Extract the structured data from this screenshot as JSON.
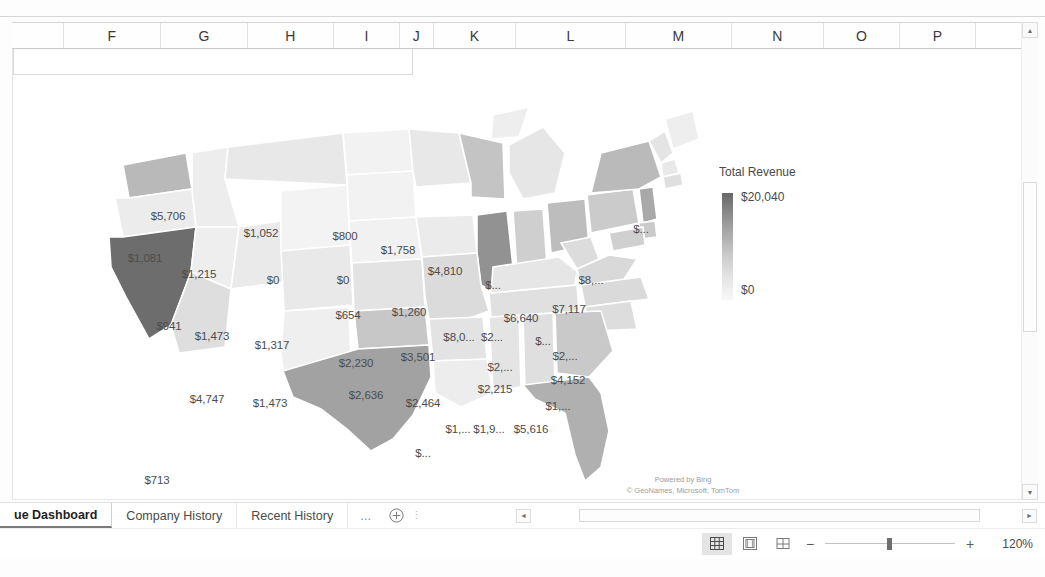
{
  "app": {
    "type": "spreadsheet",
    "zoom_level": "120%"
  },
  "columns": [
    "F",
    "G",
    "H",
    "I",
    "J",
    "K",
    "L",
    "M",
    "N",
    "O",
    "P"
  ],
  "chart": {
    "title": "",
    "legend": {
      "title": "Total Revenue",
      "max_label": "$20,040",
      "min_label": "$0",
      "gradient_high": "#686868",
      "gradient_low": "#f7f7f7"
    },
    "attribution_line1": "Powered by Bing",
    "attribution_line2": "© GeoNames, Microsoft, TomTom"
  },
  "chart_data": {
    "type": "map",
    "title": "Total Revenue",
    "value_prefix": "$",
    "legend_position": "right",
    "value_range": [
      0,
      20040
    ],
    "regions": [
      {
        "name": "Washington",
        "label": "$5,706",
        "value": 5706,
        "x": 155,
        "y": 141,
        "light": false
      },
      {
        "name": "Montana",
        "label": "$1,052",
        "value": 1052,
        "x": 248,
        "y": 158,
        "light": false
      },
      {
        "name": "North Dakota",
        "label": "$800",
        "value": 800,
        "x": 332,
        "y": 161,
        "light": false
      },
      {
        "name": "Minnesota",
        "label": "$1,758",
        "value": 1758,
        "x": 385,
        "y": 175,
        "light": false
      },
      {
        "name": "Maine",
        "label": "$...",
        "value": null,
        "x": 628,
        "y": 154,
        "light": false
      },
      {
        "name": "Oregon",
        "label": "$1,081",
        "value": 1081,
        "x": 132,
        "y": 183,
        "light": false
      },
      {
        "name": "Idaho",
        "label": "$1,215",
        "value": 1215,
        "x": 186,
        "y": 199,
        "light": false
      },
      {
        "name": "Wyoming",
        "label": "$0",
        "value": 0,
        "x": 260,
        "y": 205,
        "light": false
      },
      {
        "name": "South Dakota",
        "label": "$0",
        "value": 0,
        "x": 330,
        "y": 205,
        "light": false
      },
      {
        "name": "Wisconsin",
        "label": "$4,810",
        "value": 4810,
        "x": 432,
        "y": 196,
        "light": false
      },
      {
        "name": "Michigan",
        "label": "$...",
        "value": null,
        "x": 480,
        "y": 210,
        "light": false
      },
      {
        "name": "Vermont",
        "label": "$8,...",
        "value": null,
        "x": 578,
        "y": 205,
        "light": false
      },
      {
        "name": "New York",
        "label": "$7,117",
        "value": 7117,
        "x": 556,
        "y": 234,
        "light": false
      },
      {
        "name": "Nebraska",
        "label": "$654",
        "value": 654,
        "x": 335,
        "y": 240,
        "light": false
      },
      {
        "name": "Iowa",
        "label": "$1,260",
        "value": 1260,
        "x": 396,
        "y": 237,
        "light": false
      },
      {
        "name": "Ohio",
        "label": "$6,640",
        "value": 6640,
        "x": 508,
        "y": 243,
        "light": false
      },
      {
        "name": "Nevada",
        "label": "$941",
        "value": 941,
        "x": 156,
        "y": 251,
        "light": false
      },
      {
        "name": "Utah",
        "label": "$1,473",
        "value": 1473,
        "x": 199,
        "y": 261,
        "light": false
      },
      {
        "name": "Illinois",
        "label": "$8,0...",
        "value": null,
        "x": 446,
        "y": 262,
        "light": false
      },
      {
        "name": "Indiana",
        "label": "$2...",
        "value": null,
        "x": 479,
        "y": 262,
        "light": false
      },
      {
        "name": "Pennsylvania",
        "label": "$...",
        "value": null,
        "x": 530,
        "y": 266,
        "light": false
      },
      {
        "name": "New Jersey",
        "label": "$2,...",
        "value": null,
        "x": 552,
        "y": 281,
        "light": false
      },
      {
        "name": "Colorado",
        "label": "$1,317",
        "value": 1317,
        "x": 259,
        "y": 270,
        "light": false
      },
      {
        "name": "California",
        "label": "$20,040",
        "value": 20040,
        "x": 124,
        "y": 295,
        "light": true
      },
      {
        "name": "Kansas",
        "label": "$2,230",
        "value": 2230,
        "x": 343,
        "y": 288,
        "light": false
      },
      {
        "name": "Missouri",
        "label": "$3,501",
        "value": 3501,
        "x": 405,
        "y": 282,
        "light": false
      },
      {
        "name": "Kentucky",
        "label": "$2,...",
        "value": null,
        "x": 487,
        "y": 292,
        "light": false
      },
      {
        "name": "Maryland",
        "label": "$4,152",
        "value": 4152,
        "x": 555,
        "y": 305,
        "light": false
      },
      {
        "name": "Arizona",
        "label": "$4,747",
        "value": 4747,
        "x": 194,
        "y": 324,
        "light": false
      },
      {
        "name": "New Mexico",
        "label": "$1,473",
        "value": 1473,
        "x": 257,
        "y": 328,
        "light": false
      },
      {
        "name": "Oklahoma",
        "label": "$2,636",
        "value": 2636,
        "x": 353,
        "y": 320,
        "light": false
      },
      {
        "name": "Arkansas",
        "label": "$2,464",
        "value": 2464,
        "x": 410,
        "y": 328,
        "light": false
      },
      {
        "name": "Tennessee",
        "label": "$2,215",
        "value": 2215,
        "x": 482,
        "y": 314,
        "light": false
      },
      {
        "name": "North Carolina",
        "label": "$1,...",
        "value": null,
        "x": 545,
        "y": 331,
        "light": false
      },
      {
        "name": "Texas",
        "label": "$10,772",
        "value": 10772,
        "x": 335,
        "y": 376,
        "light": true
      },
      {
        "name": "Louisiana",
        "label": "$...",
        "value": null,
        "x": 410,
        "y": 378,
        "light": false
      },
      {
        "name": "Mississippi",
        "label": "$1,...",
        "value": null,
        "x": 445,
        "y": 354,
        "light": false
      },
      {
        "name": "Alabama",
        "label": "$1,9...",
        "value": null,
        "x": 476,
        "y": 354,
        "light": false
      },
      {
        "name": "Georgia",
        "label": "$5,616",
        "value": 5616,
        "x": 518,
        "y": 354,
        "light": false
      },
      {
        "name": "Florida",
        "label": "$...",
        "value": null,
        "x": 541,
        "y": 402,
        "light": true
      },
      {
        "name": "Hawaii",
        "label": "$713",
        "value": 713,
        "x": 144,
        "y": 405,
        "light": false
      }
    ]
  },
  "sheet_tabs": [
    {
      "label": "ue Dashboard",
      "active": true
    },
    {
      "label": "Company History",
      "active": false
    },
    {
      "label": "Recent History",
      "active": false
    }
  ],
  "tabbar": {
    "ellipsis": "...",
    "add_sheet": "+",
    "grip": "⋮"
  },
  "statusbar": {
    "view_normal": "normal-view",
    "view_page_layout": "page-layout-view",
    "view_page_break": "page-break-view",
    "zoom_out": "−",
    "zoom_in": "+",
    "zoom_level": "120%"
  },
  "scroll": {
    "up_arrow": "▲",
    "down_arrow": "▼",
    "left_arrow": "◄",
    "right_arrow": "►"
  }
}
